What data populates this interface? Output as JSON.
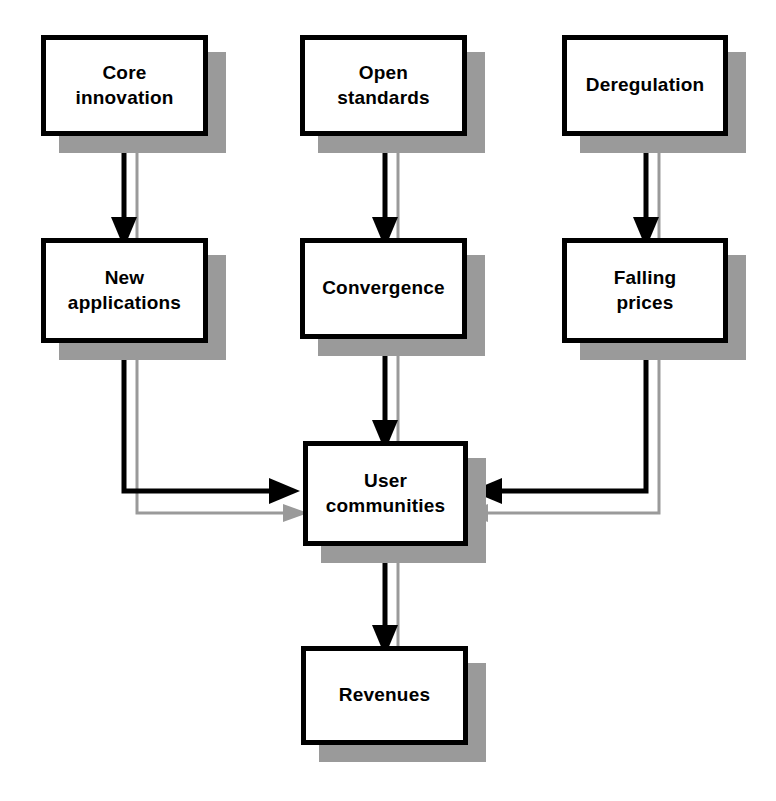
{
  "diagram": {
    "type": "flowchart",
    "colors": {
      "box_fill": "#ffffff",
      "box_border": "#000000",
      "shadow": "#9a9a9a",
      "arrow_primary": "#000000",
      "arrow_shadow": "#9a9a9a",
      "background": "#ffffff"
    },
    "nodes": [
      {
        "id": "core-innovation",
        "label": "Core\ninnovation",
        "x": 41,
        "y": 35,
        "w": 167,
        "h": 101
      },
      {
        "id": "open-standards",
        "label": "Open\nstandards",
        "x": 300,
        "y": 35,
        "w": 167,
        "h": 101
      },
      {
        "id": "deregulation",
        "label": "Deregulation",
        "x": 562,
        "y": 35,
        "w": 166,
        "h": 101
      },
      {
        "id": "new-applications",
        "label": "New\napplications",
        "x": 41,
        "y": 238,
        "w": 167,
        "h": 105
      },
      {
        "id": "convergence",
        "label": "Convergence",
        "x": 300,
        "y": 238,
        "w": 167,
        "h": 101
      },
      {
        "id": "falling-prices",
        "label": "Falling\nprices",
        "x": 562,
        "y": 238,
        "w": 166,
        "h": 105
      },
      {
        "id": "user-communities",
        "label": "User\ncommunities",
        "x": 303,
        "y": 441,
        "w": 165,
        "h": 105
      },
      {
        "id": "revenues",
        "label": "Revenues",
        "x": 301,
        "y": 646,
        "w": 167,
        "h": 99
      }
    ],
    "edges": [
      {
        "id": "core-innovation-to-new-applications",
        "from": "core-innovation",
        "to": "new-applications"
      },
      {
        "id": "open-standards-to-convergence",
        "from": "open-standards",
        "to": "convergence"
      },
      {
        "id": "deregulation-to-falling-prices",
        "from": "deregulation",
        "to": "falling-prices"
      },
      {
        "id": "new-applications-to-user-communities",
        "from": "new-applications",
        "to": "user-communities"
      },
      {
        "id": "convergence-to-user-communities",
        "from": "convergence",
        "to": "user-communities"
      },
      {
        "id": "falling-prices-to-user-communities",
        "from": "falling-prices",
        "to": "user-communities"
      },
      {
        "id": "user-communities-to-revenues",
        "from": "user-communities",
        "to": "revenues"
      }
    ]
  }
}
